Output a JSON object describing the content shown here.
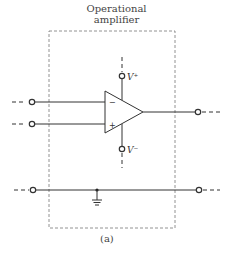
{
  "title": {
    "line1": "Operational",
    "line2": "amplifier"
  },
  "caption": "(a)",
  "labels": {
    "v_plus": "V⁺",
    "v_minus": "V⁻",
    "inverting": "−",
    "noninverting": "+"
  },
  "colors": {
    "stroke": "#333333",
    "box": "#777777",
    "background": "#ffffff"
  }
}
